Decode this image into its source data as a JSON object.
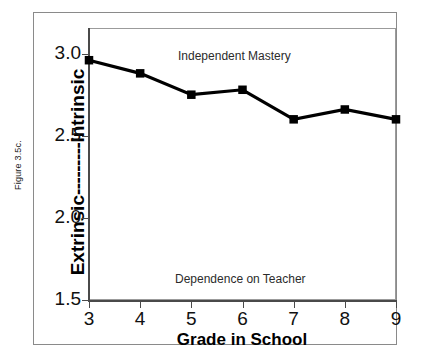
{
  "figure": {
    "caption": "Figure 3.5c.",
    "annotation_top": "Independent Mastery",
    "annotation_bottom": "Dependence on Teacher",
    "y_label_low": "Extrinsic",
    "y_label_high": "Intrinsic",
    "y_label_connector": "---------",
    "x_title": "Grade in School"
  },
  "chart_data": {
    "type": "line",
    "title": "",
    "xlabel": "Grade in School",
    "ylabel": "Extrinsic---------Intrinsic",
    "categories": [
      "3",
      "4",
      "5",
      "6",
      "7",
      "8",
      "9"
    ],
    "x": [
      3,
      4,
      5,
      6,
      7,
      8,
      9
    ],
    "values": [
      2.96,
      2.88,
      2.75,
      2.78,
      2.6,
      2.66,
      2.6
    ],
    "series": [
      {
        "name": "Motivation orientation",
        "values": [
          2.96,
          2.88,
          2.75,
          2.78,
          2.6,
          2.66,
          2.6
        ]
      }
    ],
    "ylim": [
      1.5,
      3.15
    ],
    "xlim": [
      3,
      9
    ],
    "yticks": [
      1.5,
      2.0,
      2.5,
      3.0
    ],
    "ytick_labels": [
      "1.5",
      "2.0",
      "2.5",
      "3.0"
    ],
    "xticks": [
      3,
      4,
      5,
      6,
      7,
      8,
      9
    ],
    "xtick_labels": [
      "3",
      "4",
      "5",
      "6",
      "7",
      "8",
      "9"
    ],
    "grid": false,
    "legend": "none",
    "marker": "square",
    "line_color": "#000000",
    "marker_color": "#000000",
    "annotations": [
      {
        "text": "Independent Mastery",
        "x": 5.6,
        "y": 3.05
      },
      {
        "text": "Dependence on Teacher",
        "x": 5.6,
        "y": 1.62
      }
    ]
  }
}
